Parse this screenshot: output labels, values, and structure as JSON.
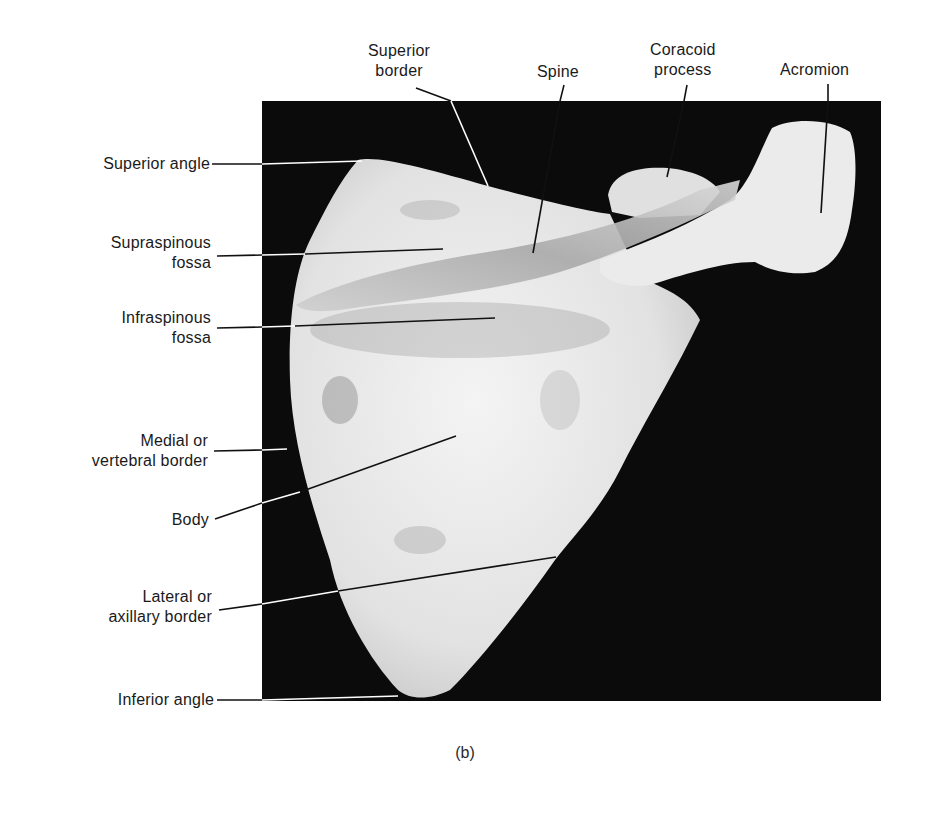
{
  "figure": {
    "caption": "(b)",
    "background_color": "#0b0b0b",
    "bone_color": "#ececec"
  },
  "labels": {
    "superior_border": [
      "Superior",
      "border"
    ],
    "spine": [
      "Spine"
    ],
    "coracoid_process": [
      "Coracoid",
      "process"
    ],
    "acromion": [
      "Acromion"
    ],
    "superior_angle": [
      "Superior angle"
    ],
    "supraspinous_fossa": [
      "Supraspinous",
      "fossa"
    ],
    "infraspinous_fossa": [
      "Infraspinous",
      "fossa"
    ],
    "medial_border": [
      "Medial or",
      "vertebral border"
    ],
    "body": [
      "Body"
    ],
    "lateral_border": [
      "Lateral or",
      "axillary border"
    ],
    "inferior_angle": [
      "Inferior angle"
    ]
  }
}
